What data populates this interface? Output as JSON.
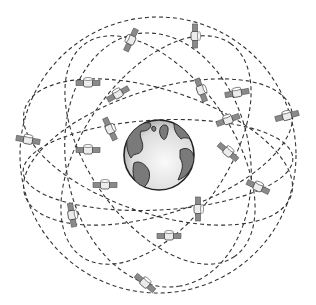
{
  "illustration": {
    "subject": "GPS satellite constellation orbiting Earth",
    "colors": {
      "background": "#ffffff",
      "orbit_line": "#333333",
      "earth_ocean": "#e6e6e6",
      "earth_ocean_highlight": "#f7f7f7",
      "earth_land": "#7a7a7a",
      "earth_outline": "#222222",
      "satellite_panel": "#8a8a8a",
      "satellite_body": "#e8e8e8",
      "satellite_outline": "#555555"
    },
    "earth": {
      "cx": 159,
      "cy": 155,
      "r": 35
    },
    "orbits": [
      {
        "cx": 158,
        "cy": 155,
        "rx": 138,
        "ry": 138,
        "rot": 0
      },
      {
        "cx": 158,
        "cy": 152,
        "rx": 140,
        "ry": 62,
        "rot": -18
      },
      {
        "cx": 158,
        "cy": 152,
        "rx": 140,
        "ry": 62,
        "rot": 18
      },
      {
        "cx": 160,
        "cy": 150,
        "rx": 130,
        "ry": 72,
        "rot": 55
      },
      {
        "cx": 156,
        "cy": 150,
        "rx": 130,
        "ry": 72,
        "rot": -55
      },
      {
        "cx": 158,
        "cy": 160,
        "rx": 128,
        "ry": 92,
        "rot": 80
      },
      {
        "cx": 158,
        "cy": 165,
        "rx": 135,
        "ry": 45,
        "rot": -3
      }
    ],
    "satellites": [
      {
        "x": 131,
        "y": 40,
        "rot": -65
      },
      {
        "x": 195,
        "y": 36,
        "rot": 90
      },
      {
        "x": 118,
        "y": 94,
        "rot": -30
      },
      {
        "x": 201,
        "y": 90,
        "rot": 70
      },
      {
        "x": 237,
        "y": 93,
        "rot": -10
      },
      {
        "x": 287,
        "y": 116,
        "rot": -15
      },
      {
        "x": 110,
        "y": 129,
        "rot": 65
      },
      {
        "x": 28,
        "y": 140,
        "rot": 10
      },
      {
        "x": 88,
        "y": 150,
        "rot": 0
      },
      {
        "x": 228,
        "y": 152,
        "rot": 40
      },
      {
        "x": 105,
        "y": 185,
        "rot": 0
      },
      {
        "x": 258,
        "y": 187,
        "rot": 25
      },
      {
        "x": 72,
        "y": 215,
        "rot": 80
      },
      {
        "x": 198,
        "y": 209,
        "rot": 90
      },
      {
        "x": 169,
        "y": 236,
        "rot": 0
      },
      {
        "x": 145,
        "y": 283,
        "rot": 40
      },
      {
        "x": 88,
        "y": 83,
        "rot": 0
      },
      {
        "x": 228,
        "y": 120,
        "rot": -20
      }
    ]
  }
}
